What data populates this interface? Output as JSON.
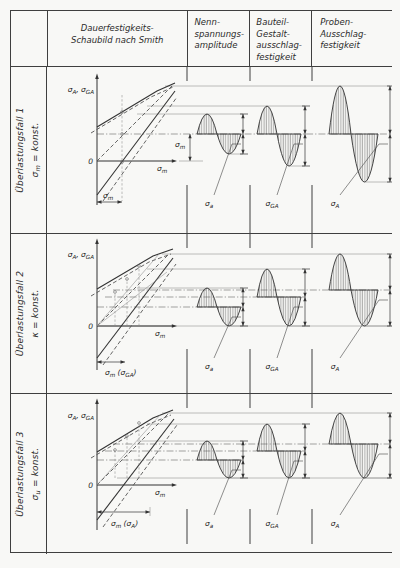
{
  "header": {
    "smith": [
      "Dauerfestigkeits-",
      "Schaubild nach Smith"
    ],
    "nenn": [
      "Nenn-",
      "spannungs-",
      "amplitude"
    ],
    "bauteil": [
      "Bauteil-",
      "Gestalt-",
      "ausschlag-",
      "festigkeit"
    ],
    "proben": [
      "Proben-",
      "Ausschlag-",
      "festigkeit"
    ]
  },
  "rows": [
    {
      "case": "Überlastungsfall 1",
      "cond_sym": "σ",
      "cond_sub": "m",
      "cond_rest": " = konst."
    },
    {
      "case": "Überlastungsfall 2",
      "cond_sym": "κ",
      "cond_sub": "",
      "cond_rest": " = konst."
    },
    {
      "case": "Überlastungsfall 3",
      "cond_sym": "σ",
      "cond_sub": "u",
      "cond_rest": " = konst."
    }
  ],
  "labels": {
    "axisY": {
      "s1": "σ",
      "s1b": "A",
      "s2": ", σ",
      "s2b": "GA"
    },
    "zero": "0",
    "sm": {
      "s": "σ",
      "b": "m"
    },
    "smga": {
      "s": "σ",
      "b": "m",
      "p": " (σ",
      "q": "GA",
      "r": ")"
    },
    "sma": {
      "s": "σ",
      "b": "m",
      "p": " (σ",
      "q": "A",
      "r": ")"
    },
    "wa": {
      "s": "σ",
      "b": "a"
    },
    "wga": {
      "s": "σ",
      "b": "GA"
    },
    "wA": {
      "s": "σ",
      "b": "A"
    }
  },
  "diagram": {
    "line_color": "#333333",
    "paper_color": "#f8f8f6",
    "rows": [
      {
        "label_y": 139,
        "mean_lines": [
          {
            "y": 67,
            "x1": 50,
            "x2": 345
          }
        ],
        "connectors": [
          {
            "y": 19,
            "x1": 118,
            "x2": 343
          },
          {
            "y": 39,
            "x1": 100,
            "x2": 258
          },
          {
            "y": 47,
            "x1": 90,
            "x2": 196
          }
        ],
        "waves": [
          {
            "x": 150,
            "wp": 20,
            "wn": 24,
            "mean": 67,
            "up": 20,
            "dn": 20,
            "dim": 196,
            "lx": 162
          },
          {
            "x": 210,
            "wp": 20,
            "wn": 24,
            "mean": 67,
            "up": 28,
            "dn": 32,
            "dim": 258,
            "lx": 225
          },
          {
            "x": 282,
            "wp": 22,
            "wn": 27,
            "mean": 67,
            "up": 48,
            "dn": 48,
            "dim": 343,
            "lx": 288
          }
        ]
      },
      {
        "label_y": 135,
        "mean_lines": [
          {
            "y": 73,
            "x1": 50,
            "x2": 196
          },
          {
            "y": 63,
            "x1": 58,
            "x2": 258
          },
          {
            "y": 56,
            "x1": 66,
            "x2": 343
          }
        ],
        "connectors": [
          {
            "y": 20,
            "x1": 115,
            "x2": 343
          },
          {
            "y": 35,
            "x1": 100,
            "x2": 258
          },
          {
            "y": 54,
            "x1": 90,
            "x2": 196
          },
          {
            "y": 92,
            "x1": 50,
            "x2": 345
          }
        ],
        "waves": [
          {
            "x": 150,
            "wp": 20,
            "wn": 24,
            "mean": 73,
            "up": 19,
            "dn": 19,
            "dim": 196,
            "lx": 162
          },
          {
            "x": 210,
            "wp": 20,
            "wn": 24,
            "mean": 63,
            "up": 28,
            "dn": 29,
            "dim": 258,
            "lx": 225
          },
          {
            "x": 282,
            "wp": 22,
            "wn": 27,
            "mean": 56,
            "up": 36,
            "dn": 36,
            "dim": 343,
            "lx": 288
          }
        ]
      },
      {
        "label_y": 132,
        "mean_lines": [
          {
            "y": 66,
            "x1": 50,
            "x2": 196
          },
          {
            "y": 57,
            "x1": 58,
            "x2": 258
          },
          {
            "y": 50,
            "x1": 66,
            "x2": 343
          }
        ],
        "connectors": [
          {
            "y": 19,
            "x1": 115,
            "x2": 343
          },
          {
            "y": 30,
            "x1": 100,
            "x2": 258
          },
          {
            "y": 47,
            "x1": 90,
            "x2": 196
          },
          {
            "y": 84,
            "x1": 70,
            "x2": 345
          }
        ],
        "waves": [
          {
            "x": 150,
            "wp": 20,
            "wn": 24,
            "mean": 66,
            "up": 19,
            "dn": 18,
            "dim": 196,
            "lx": 162
          },
          {
            "x": 210,
            "wp": 20,
            "wn": 24,
            "mean": 57,
            "up": 27,
            "dn": 27,
            "dim": 258,
            "lx": 225
          },
          {
            "x": 282,
            "wp": 22,
            "wn": 27,
            "mean": 50,
            "up": 31,
            "dn": 34,
            "dim": 343,
            "lx": 288
          }
        ]
      }
    ]
  }
}
